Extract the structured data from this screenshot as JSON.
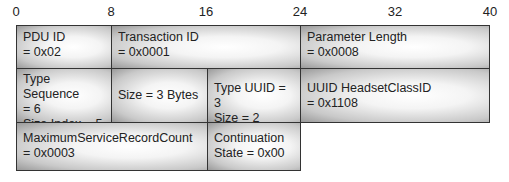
{
  "axis": {
    "ticks": [
      {
        "label": "0",
        "x": 16
      },
      {
        "label": "8",
        "x": 111
      },
      {
        "label": "16",
        "x": 206
      },
      {
        "label": "24",
        "x": 300
      },
      {
        "label": "32",
        "x": 395
      },
      {
        "label": "40",
        "x": 490
      }
    ]
  },
  "rows": [
    {
      "fields": [
        {
          "lines": [
            "PDU ID",
            "= 0x02"
          ]
        },
        {
          "lines": [
            "Transaction ID",
            "= 0x0001"
          ]
        },
        {
          "lines": [
            "Parameter Length",
            "= 0x0008"
          ]
        }
      ]
    },
    {
      "fields": [
        {
          "lines": [
            "Type Sequence",
            "= 6",
            "Size Index = 5"
          ]
        },
        {
          "lines": [
            "Size = 3 Bytes"
          ]
        },
        {
          "lines": [
            "Type UUID = 3",
            "Size = 2 Bytes"
          ]
        },
        {
          "lines": [
            "UUID HeadsetClassID",
            "= 0x1108"
          ]
        }
      ]
    },
    {
      "fields": [
        {
          "lines": [
            "MaximumServiceRecordCount",
            "= 0x0003"
          ]
        },
        {
          "lines": [
            "Continuation",
            "State = 0x00"
          ]
        }
      ]
    }
  ]
}
